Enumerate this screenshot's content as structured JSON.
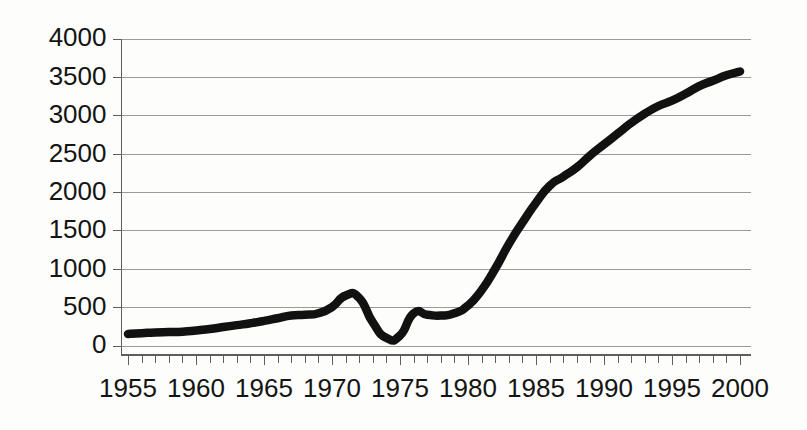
{
  "chart_data": {
    "type": "line",
    "title": "",
    "subtitle": "",
    "xlabel": "",
    "ylabel": "",
    "xlim": [
      1954.5,
      2000.5
    ],
    "ylim": [
      0,
      4000
    ],
    "grid": true,
    "legend": false,
    "legend_position": "none",
    "line_color": "#111111",
    "background_color": "#fdfdfb",
    "gridline_color": "#9a9a9a",
    "axis_color": "#5e5e5e",
    "y_ticks": [
      0,
      500,
      1000,
      1500,
      2000,
      2500,
      3000,
      3500,
      4000
    ],
    "y_tick_labels": [
      "0",
      "500",
      "1000",
      "1500",
      "2000",
      "2500",
      "3000",
      "3500",
      "4000"
    ],
    "x_ticks": [
      1955,
      1956,
      1957,
      1958,
      1959,
      1960,
      1961,
      1962,
      1963,
      1964,
      1965,
      1966,
      1967,
      1968,
      1969,
      1970,
      1971,
      1972,
      1973,
      1974,
      1975,
      1976,
      1977,
      1978,
      1979,
      1980,
      1981,
      1982,
      1983,
      1984,
      1985,
      1986,
      1987,
      1988,
      1989,
      1990,
      1991,
      1992,
      1993,
      1994,
      1995,
      1996,
      1997,
      1998,
      1999,
      2000
    ],
    "x_tick_labels_major": [
      "1955",
      "1960",
      "1965",
      "1970",
      "1975",
      "1980",
      "1985",
      "1990",
      "1995",
      "2000"
    ],
    "x_ticks_major": [
      1955,
      1960,
      1965,
      1970,
      1975,
      1980,
      1985,
      1990,
      1995,
      2000
    ],
    "x": [
      1955,
      1956,
      1957,
      1958,
      1959,
      1960,
      1961,
      1962,
      1963,
      1964,
      1965,
      1966,
      1967,
      1968,
      1969,
      1970,
      1971,
      1972,
      1973,
      1974,
      1975,
      1976,
      1977,
      1978,
      1979,
      1980,
      1981,
      1982,
      1983,
      1984,
      1985,
      1986,
      1987,
      1988,
      1989,
      1990,
      1991,
      1992,
      1993,
      1994,
      1995,
      1996,
      1997,
      1998,
      1999,
      2000
    ],
    "values": [
      150,
      160,
      170,
      175,
      180,
      195,
      215,
      240,
      265,
      290,
      320,
      355,
      390,
      400,
      420,
      500,
      650,
      620,
      300,
      100,
      130,
      420,
      400,
      390,
      420,
      520,
      720,
      1000,
      1320,
      1600,
      1860,
      2080,
      2200,
      2320,
      2480,
      2620,
      2760,
      2900,
      3020,
      3120,
      3190,
      3280,
      3380,
      3450,
      3520,
      3570
    ],
    "series": [
      {
        "name": "series-1",
        "values": [
          150,
          160,
          170,
          175,
          180,
          195,
          215,
          240,
          265,
          290,
          320,
          355,
          390,
          400,
          420,
          500,
          650,
          620,
          300,
          100,
          130,
          420,
          400,
          390,
          420,
          520,
          720,
          1000,
          1320,
          1600,
          1860,
          2080,
          2200,
          2320,
          2480,
          2620,
          2760,
          2900,
          3020,
          3120,
          3190,
          3280,
          3380,
          3450,
          3520,
          3570
        ]
      }
    ],
    "annotations": []
  }
}
